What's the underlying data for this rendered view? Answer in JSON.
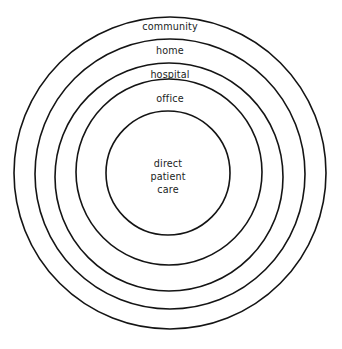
{
  "diagram": {
    "type": "concentric-circles",
    "title": "",
    "background_color": "#ffffff",
    "stroke_color": "#141414",
    "text_color": "#201d1c",
    "rings": [
      {
        "label": "community",
        "level": 5,
        "cx": 170,
        "cy": 173,
        "r": 156,
        "stroke_width": 1.6,
        "label_x": 170,
        "label_y": 30
      },
      {
        "label": "home",
        "level": 4,
        "cx": 170,
        "cy": 174,
        "r": 135,
        "stroke_width": 1.6,
        "label_x": 170,
        "label_y": 54
      },
      {
        "label": "hospital",
        "level": 3,
        "cx": 169,
        "cy": 177,
        "r": 114,
        "stroke_width": 1.6,
        "label_x": 170,
        "label_y": 78
      },
      {
        "label": "office",
        "level": 2,
        "cx": 169,
        "cy": 172,
        "r": 93,
        "stroke_width": 1.6,
        "label_x": 170,
        "label_y": 102
      },
      {
        "label": "",
        "level": 1,
        "cx": 168,
        "cy": 173,
        "r": 62,
        "stroke_width": 1.6,
        "label_x": 168,
        "label_y": 0
      }
    ],
    "core": {
      "lines": [
        "direct",
        "patient",
        "care"
      ],
      "line1": "direct",
      "line2": "patient",
      "line3": "care",
      "cx": 168,
      "line1_y": 167,
      "line2_y": 180,
      "line3_y": 193
    }
  }
}
